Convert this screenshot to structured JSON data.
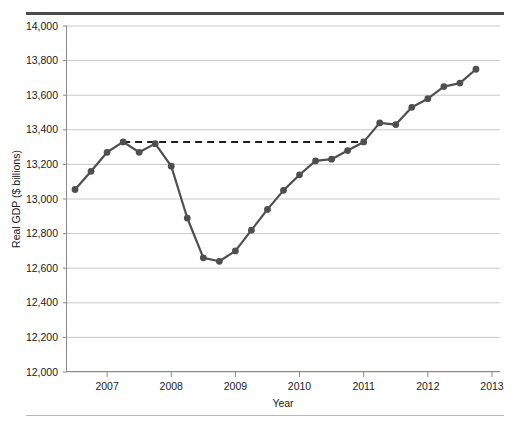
{
  "chart_data": {
    "type": "line",
    "title": "",
    "xlabel": "Year",
    "ylabel": "Real GDP ($ billions)",
    "xlim": [
      2006.375,
      2013.125
    ],
    "ylim": [
      12000,
      14000
    ],
    "grid": true,
    "legend": false,
    "y_ticks": [
      "12,000",
      "12,200",
      "12,400",
      "12,600",
      "12,800",
      "13,000",
      "13,200",
      "13,400",
      "13,600",
      "13,800",
      "14,000"
    ],
    "y_tick_values": [
      12000,
      12200,
      12400,
      12600,
      12800,
      13000,
      13200,
      13400,
      13600,
      13800,
      14000
    ],
    "x_ticks": [
      "2007",
      "2008",
      "2009",
      "2010",
      "2011",
      "2012",
      "2013"
    ],
    "x_tick_values": [
      2007,
      2008,
      2009,
      2010,
      2011,
      2012,
      2013
    ],
    "series": [
      {
        "name": "Real GDP",
        "marker": "circle",
        "color": "#4f4f4f",
        "x": [
          2006.5,
          2006.75,
          2007.0,
          2007.25,
          2007.5,
          2007.75,
          2008.0,
          2008.25,
          2008.5,
          2008.75,
          2009.0,
          2009.25,
          2009.5,
          2009.75,
          2010.0,
          2010.25,
          2010.5,
          2010.75,
          2011.0,
          2011.25,
          2011.5,
          2011.75,
          2012.0,
          2012.25,
          2012.5,
          2012.75
        ],
        "values": [
          13055,
          13160,
          13270,
          13330,
          13270,
          13320,
          13190,
          12890,
          12660,
          12640,
          12700,
          12820,
          12940,
          13050,
          13140,
          13220,
          13230,
          13280,
          13330,
          13440,
          13430,
          13530,
          13580,
          13650,
          13670,
          13750
        ]
      }
    ],
    "annotations": [
      {
        "name": "pre-recession-peak-reference",
        "type": "horizontal-dashed-line",
        "y": 13330,
        "x_start": 2007.25,
        "x_end": 2011.0,
        "color": "#1f1f1f"
      }
    ]
  }
}
